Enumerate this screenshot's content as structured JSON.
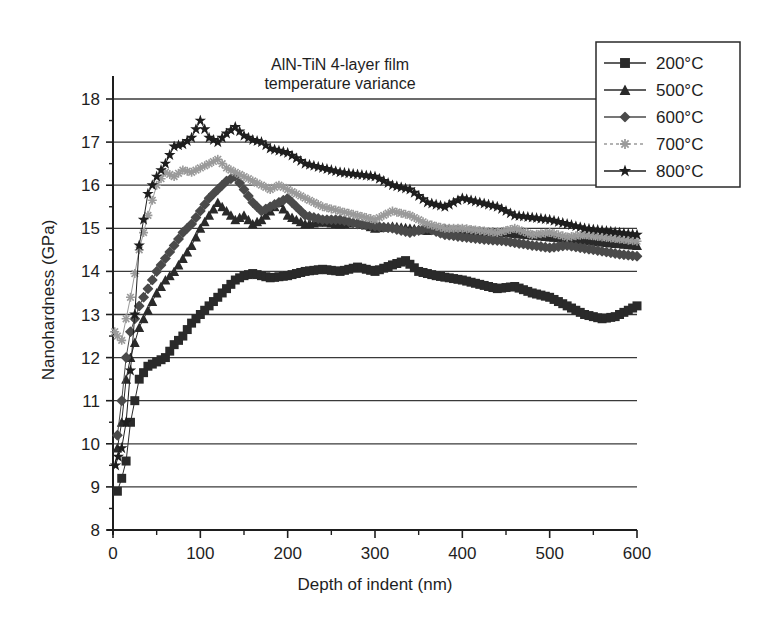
{
  "chart_data": {
    "type": "line",
    "title": "AlN-TiN 4-layer film\ntemperature variance",
    "title_lines": [
      "AlN-TiN 4-layer film",
      "temperature variance"
    ],
    "xlabel": "Depth of indent (nm)",
    "ylabel": "Nanohardness (GPa)",
    "xlim": [
      0,
      600
    ],
    "ylim": [
      8,
      18
    ],
    "xticks": [
      0,
      100,
      200,
      300,
      400,
      500,
      600
    ],
    "yticks": [
      8,
      9,
      10,
      11,
      12,
      13,
      14,
      15,
      16,
      17,
      18
    ],
    "grid": {
      "horizontal": true,
      "vertical": false
    },
    "legend_position": "upper right (outside plot, overlapping top-right)",
    "series": [
      {
        "name": "200°C",
        "marker": "square",
        "color": "#2a2a2a",
        "x": [
          5,
          10,
          15,
          20,
          25,
          30,
          40,
          50,
          60,
          70,
          80,
          90,
          100,
          110,
          120,
          130,
          140,
          150,
          160,
          180,
          200,
          220,
          240,
          260,
          280,
          300,
          320,
          335,
          350,
          370,
          400,
          420,
          440,
          460,
          480,
          500,
          520,
          540,
          560,
          575,
          590,
          600
        ],
        "y": [
          8.9,
          9.2,
          9.6,
          10.5,
          11.0,
          11.5,
          11.8,
          11.9,
          12.0,
          12.3,
          12.5,
          12.8,
          13.0,
          13.2,
          13.4,
          13.6,
          13.8,
          13.9,
          13.95,
          13.85,
          13.9,
          14.0,
          14.05,
          14.0,
          14.1,
          14.0,
          14.15,
          14.25,
          14.0,
          13.9,
          13.8,
          13.7,
          13.6,
          13.65,
          13.5,
          13.4,
          13.2,
          13.0,
          12.9,
          12.95,
          13.1,
          13.2
        ]
      },
      {
        "name": "500°C",
        "marker": "triangle",
        "color": "#2a2a2a",
        "x": [
          5,
          10,
          15,
          20,
          30,
          40,
          50,
          60,
          70,
          80,
          90,
          100,
          110,
          120,
          130,
          140,
          150,
          160,
          170,
          180,
          190,
          200,
          220,
          240,
          260,
          280,
          300,
          320,
          340,
          360,
          380,
          400,
          450,
          500,
          550,
          600
        ],
        "y": [
          9.9,
          10.5,
          11.5,
          12.0,
          12.7,
          13.1,
          13.5,
          13.8,
          14.0,
          14.3,
          14.6,
          15.0,
          15.3,
          15.6,
          15.4,
          15.2,
          15.3,
          15.1,
          15.2,
          15.4,
          15.6,
          15.3,
          15.1,
          15.15,
          15.1,
          15.15,
          15.0,
          15.05,
          15.0,
          14.95,
          15.0,
          14.95,
          14.9,
          14.8,
          14.7,
          14.6
        ]
      },
      {
        "name": "600°C",
        "marker": "diamond",
        "color": "#4a4a4a",
        "x": [
          5,
          10,
          15,
          20,
          30,
          40,
          50,
          60,
          70,
          80,
          90,
          100,
          110,
          120,
          130,
          140,
          150,
          160,
          170,
          180,
          190,
          200,
          210,
          220,
          240,
          260,
          280,
          300,
          320,
          340,
          360,
          380,
          400,
          420,
          450,
          480,
          500,
          520,
          550,
          580,
          600
        ],
        "y": [
          10.2,
          11.0,
          12.0,
          12.6,
          13.2,
          13.6,
          14.0,
          14.3,
          14.6,
          14.9,
          15.1,
          15.4,
          15.7,
          15.9,
          16.1,
          16.2,
          15.9,
          15.6,
          15.4,
          15.5,
          15.6,
          15.7,
          15.5,
          15.3,
          15.2,
          15.2,
          15.1,
          15.05,
          15.0,
          14.9,
          15.0,
          14.85,
          14.8,
          14.75,
          14.7,
          14.6,
          14.55,
          14.6,
          14.5,
          14.4,
          14.35
        ]
      },
      {
        "name": "700°C",
        "marker": "asterisk",
        "color": "#9a9a9a",
        "x": [
          2,
          5,
          10,
          15,
          20,
          30,
          40,
          50,
          60,
          70,
          80,
          90,
          100,
          110,
          120,
          130,
          140,
          150,
          160,
          170,
          180,
          190,
          200,
          220,
          240,
          260,
          280,
          300,
          320,
          340,
          360,
          380,
          400,
          420,
          440,
          460,
          480,
          500,
          520,
          540,
          560,
          580,
          600
        ],
        "y": [
          12.6,
          12.5,
          12.4,
          12.9,
          13.4,
          14.5,
          15.3,
          16.0,
          16.3,
          16.2,
          16.35,
          16.3,
          16.4,
          16.5,
          16.6,
          16.4,
          16.3,
          16.2,
          16.1,
          16.0,
          15.9,
          16.0,
          15.9,
          15.7,
          15.5,
          15.4,
          15.3,
          15.2,
          15.4,
          15.3,
          15.1,
          15.0,
          15.0,
          14.95,
          14.9,
          15.0,
          14.85,
          14.9,
          14.8,
          14.85,
          14.8,
          14.75,
          14.7
        ]
      },
      {
        "name": "800°C",
        "marker": "star",
        "color": "#1e1e1e",
        "x": [
          3,
          6,
          10,
          15,
          20,
          25,
          30,
          40,
          50,
          60,
          70,
          80,
          90,
          100,
          110,
          120,
          130,
          140,
          150,
          160,
          170,
          180,
          190,
          200,
          220,
          240,
          260,
          280,
          300,
          320,
          340,
          360,
          380,
          400,
          420,
          440,
          460,
          480,
          500,
          520,
          540,
          560,
          580,
          600
        ],
        "y": [
          9.5,
          9.7,
          9.9,
          10.5,
          11.7,
          13.0,
          14.6,
          15.8,
          16.2,
          16.5,
          16.9,
          16.95,
          17.1,
          17.5,
          17.1,
          17.0,
          17.2,
          17.35,
          17.15,
          17.05,
          17.0,
          16.85,
          16.8,
          16.75,
          16.5,
          16.4,
          16.3,
          16.25,
          16.2,
          16.0,
          15.9,
          15.6,
          15.5,
          15.7,
          15.6,
          15.5,
          15.3,
          15.25,
          15.2,
          15.1,
          15.0,
          14.95,
          14.9,
          14.85
        ]
      }
    ]
  }
}
